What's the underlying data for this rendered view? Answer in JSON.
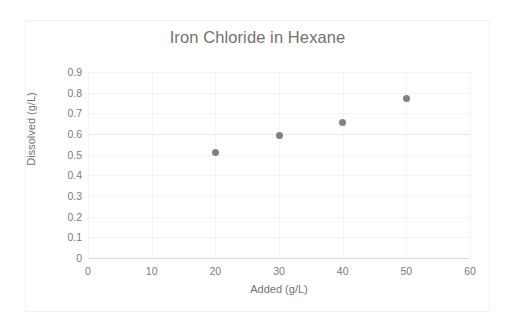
{
  "chart_data": {
    "type": "scatter",
    "title": "Iron Chloride in Hexane",
    "xlabel": "Added (g/L)",
    "ylabel": "Dissolved (g/L)",
    "xlim": [
      0,
      60
    ],
    "ylim": [
      0,
      0.9
    ],
    "grid": true,
    "legend": null,
    "x_ticks": [
      "0",
      "10",
      "20",
      "30",
      "40",
      "50",
      "60"
    ],
    "x_tick_values": [
      0,
      10,
      20,
      30,
      40,
      50,
      60
    ],
    "y_ticks": [
      "0",
      "0.1",
      "0.2",
      "0.3",
      "0.4",
      "0.5",
      "0.6",
      "0.7",
      "0.8",
      "0.9"
    ],
    "y_tick_values": [
      0,
      0.1,
      0.2,
      0.3,
      0.4,
      0.5,
      0.6,
      0.7,
      0.8,
      0.9
    ],
    "series": [
      {
        "name": "Dissolved",
        "marker": "circle",
        "color": "#808080",
        "x": [
          20,
          30,
          40,
          50
        ],
        "values": [
          0.512,
          0.593,
          0.655,
          0.772
        ]
      }
    ]
  },
  "colors": {
    "marker": "#808080",
    "title_text": "#767171",
    "tick_text": "#7b7b7b",
    "gridline": "#f4f4f4",
    "gridline_major": "#ebebeb",
    "axis_line": "#d9d9d9",
    "frame_border": "#f2f2f2",
    "background": "#ffffff"
  }
}
